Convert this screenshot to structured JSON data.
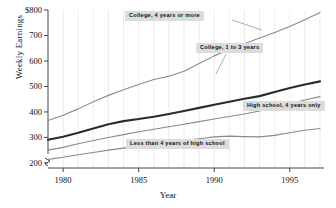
{
  "chart_data": {
    "type": "line",
    "title": "",
    "xlabel": "Year",
    "ylabel": "Weekly Earnings",
    "xlim": [
      1979,
      1997
    ],
    "ylim": [
      180,
      800
    ],
    "ytick_labels": [
      "$800",
      "700",
      "600",
      "500",
      "400",
      "300",
      "200"
    ],
    "yticks": [
      800,
      700,
      600,
      500,
      400,
      300,
      200
    ],
    "xtick_labels": [
      "1980",
      "1985",
      "1990",
      "1995"
    ],
    "xticks": [
      1980,
      1985,
      1990,
      1995
    ],
    "grid": "minor-vertical-yearly",
    "axis_break": "y-axis break below 200",
    "legend": "inline-annotations",
    "x": [
      1979,
      1980,
      1981,
      1982,
      1983,
      1984,
      1985,
      1986,
      1987,
      1988,
      1989,
      1990,
      1991,
      1992,
      1993,
      1994,
      1995,
      1996,
      1997
    ],
    "series": [
      {
        "name": "College, 4 years or more",
        "color": "#8a8a8a",
        "weight": "thin",
        "values": [
          366,
          387,
          412,
          440,
          465,
          487,
          508,
          527,
          540,
          560,
          590,
          620,
          645,
          668,
          690,
          712,
          735,
          762,
          790
        ]
      },
      {
        "name": "College, 1 to 3 years",
        "color": "#2b2b2b",
        "weight": "bold",
        "values": [
          291,
          303,
          318,
          335,
          352,
          364,
          372,
          381,
          392,
          404,
          416,
          428,
          440,
          452,
          462,
          478,
          494,
          508,
          520
        ]
      },
      {
        "name": "High school, 4 years only",
        "color": "#8a8a8a",
        "weight": "thin",
        "values": [
          250,
          261,
          275,
          288,
          300,
          311,
          322,
          332,
          342,
          352,
          362,
          372,
          382,
          392,
          404,
          418,
          432,
          447,
          460
        ]
      },
      {
        "name": "Less than 4 years of high school",
        "color": "#8a8a8a",
        "weight": "thin",
        "values": [
          214,
          222,
          232,
          241,
          250,
          258,
          266,
          273,
          280,
          288,
          295,
          302,
          305,
          303,
          302,
          308,
          318,
          328,
          335
        ]
      }
    ],
    "annotations": [
      {
        "text": "College, 4 years or more",
        "series": "College, 4 years or more"
      },
      {
        "text": "College, 1 to 3 years",
        "series": "College, 1 to 3 years"
      },
      {
        "text": "High school, 4 years only",
        "series": "High school, 4 years only"
      },
      {
        "text": "Less than 4 years of high school",
        "series": "Less than 4 years of high school"
      }
    ]
  }
}
